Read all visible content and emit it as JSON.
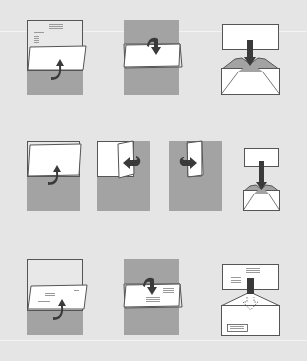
{
  "colors": {
    "background": "#e5e5e5",
    "shade": "#a3a3a3",
    "paper": "#ffffff",
    "outline": "#555555",
    "arrow": "#3a3a3a",
    "text_lines": "#9a9a9a"
  },
  "rows": [
    {
      "name": "row-standard-letter",
      "steps": [
        {
          "name": "fold-bottom-up",
          "arrow": "curved-up"
        },
        {
          "name": "fold-top-down",
          "arrow": "curved-down"
        },
        {
          "name": "insert-into-envelope",
          "arrow": "straight-down"
        }
      ]
    },
    {
      "name": "row-small-envelope",
      "steps": [
        {
          "name": "fold-bottom-up",
          "arrow": "curved-up"
        },
        {
          "name": "fold-right-in",
          "arrow": "curved-left"
        },
        {
          "name": "fold-left-in",
          "arrow": "curved-right"
        },
        {
          "name": "insert-into-envelope",
          "arrow": "straight-down"
        }
      ]
    },
    {
      "name": "row-window-envelope",
      "steps": [
        {
          "name": "fold-bottom-up",
          "arrow": "curved-up"
        },
        {
          "name": "fold-top-down",
          "arrow": "curved-down"
        },
        {
          "name": "insert-into-window-envelope",
          "arrow": "dashed-down"
        }
      ]
    }
  ]
}
